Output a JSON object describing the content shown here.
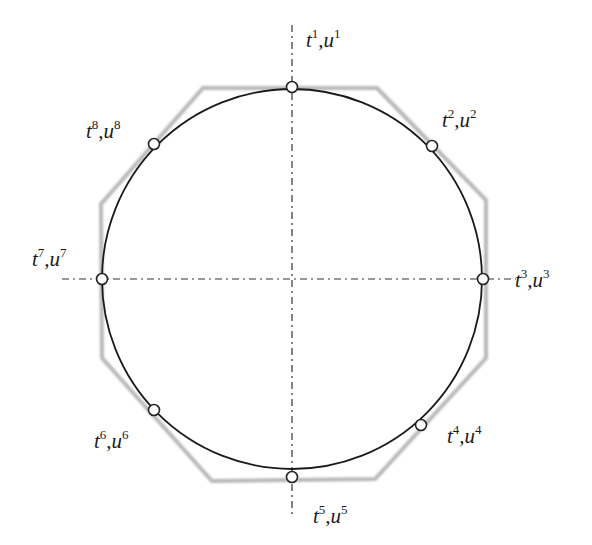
{
  "diagram": {
    "colors": {
      "circle": "#1a1a1a",
      "octagon": "#b8b8b8",
      "axes": "#333333",
      "point_fill": "#ffffff",
      "point_stroke": "#222222"
    },
    "circle": {
      "cx": 292,
      "cy": 279,
      "r": 190
    },
    "axes": {
      "horizontal": {
        "x1": 62,
        "x2": 516,
        "y": 279
      },
      "vertical": {
        "x": 292,
        "y1": 25,
        "y2": 515
      }
    },
    "octagon_vertices": [
      [
        203,
        88
      ],
      [
        377,
        88
      ],
      [
        486,
        200
      ],
      [
        486,
        358
      ],
      [
        375,
        479
      ],
      [
        212,
        481
      ],
      [
        102,
        358
      ],
      [
        101,
        204
      ]
    ],
    "points": [
      {
        "id": 1,
        "x": 292,
        "y": 87,
        "t": "t",
        "u": "u",
        "idx": "1",
        "label_x": 306,
        "label_y": 47
      },
      {
        "id": 2,
        "x": 432,
        "y": 146,
        "t": "t",
        "u": "u",
        "idx": "2",
        "label_x": 442,
        "label_y": 127
      },
      {
        "id": 3,
        "x": 483,
        "y": 279,
        "t": "t",
        "u": "u",
        "idx": "3",
        "label_x": 515,
        "label_y": 287
      },
      {
        "id": 4,
        "x": 421,
        "y": 425,
        "t": "t",
        "u": "u",
        "idx": "4",
        "label_x": 447,
        "label_y": 443
      },
      {
        "id": 5,
        "x": 292,
        "y": 477,
        "t": "t",
        "u": "u",
        "idx": "5",
        "label_x": 313,
        "label_y": 523
      },
      {
        "id": 6,
        "x": 154,
        "y": 410,
        "t": "t",
        "u": "u",
        "idx": "6",
        "label_x": 94,
        "label_y": 448
      },
      {
        "id": 7,
        "x": 102,
        "y": 279,
        "t": "t",
        "u": "u",
        "idx": "7",
        "label_x": 32,
        "label_y": 266
      },
      {
        "id": 8,
        "x": 154,
        "y": 144,
        "t": "t",
        "u": "u",
        "idx": "8",
        "label_x": 86,
        "label_y": 138
      }
    ]
  }
}
